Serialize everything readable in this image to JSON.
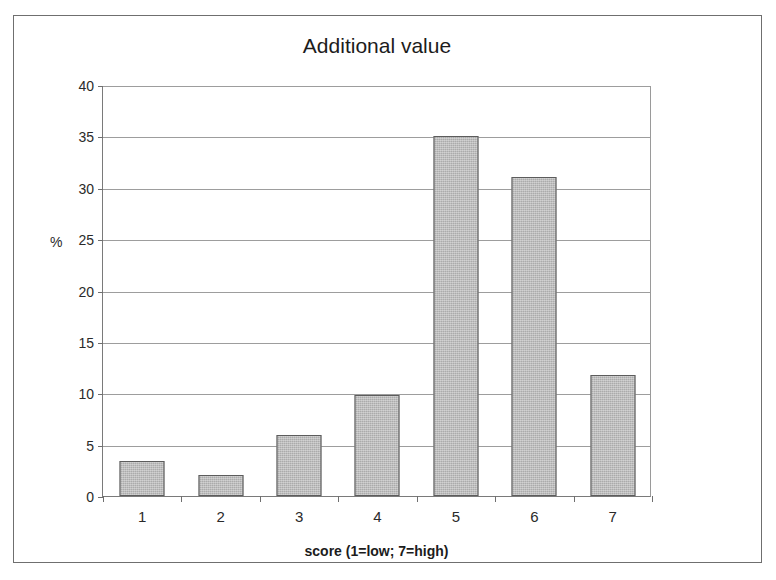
{
  "figure": {
    "background": "#ffffff",
    "frame_color": "#6f6f6f",
    "bar_fill": "#ababab",
    "bar_border": "#5c5c5c",
    "grid_color": "#9d9d9d"
  },
  "chart_data": {
    "type": "bar",
    "title": "Additional value",
    "xlabel": "score (1=low; 7=high)",
    "ylabel": "%",
    "categories": [
      "1",
      "2",
      "3",
      "4",
      "5",
      "6",
      "7"
    ],
    "values": [
      3.4,
      2.0,
      5.9,
      9.8,
      35.0,
      31.0,
      11.8
    ],
    "ylim": [
      0,
      40
    ],
    "ytick_labels": [
      "0",
      "5",
      "10",
      "15",
      "20",
      "25",
      "30",
      "35",
      "40"
    ],
    "ytick_values": [
      0,
      5,
      10,
      15,
      20,
      25,
      30,
      35,
      40
    ],
    "grid": "horizontal",
    "legend": "none"
  }
}
